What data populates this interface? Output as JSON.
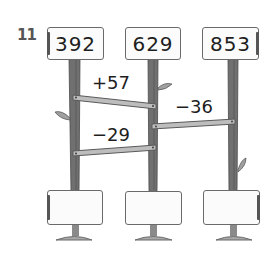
{
  "exercise": {
    "number": "11"
  },
  "top_signs": [
    {
      "value": "392"
    },
    {
      "value": "629"
    },
    {
      "value": "853"
    }
  ],
  "operations": [
    {
      "label": "+57",
      "from": "392",
      "to_post": 2
    },
    {
      "label": "−36",
      "from": "853",
      "to_post": 2
    },
    {
      "label": "−29",
      "from": "629",
      "to_post": 1
    }
  ],
  "bottom_signs": [
    {
      "value": ""
    },
    {
      "value": ""
    },
    {
      "value": ""
    }
  ],
  "colors": {
    "post": "#6e6e6e",
    "post_dark": "#4a4a4a",
    "plank": "#bdbdbd",
    "sign_border": "#6a6a6a",
    "base": "#a8a8a8",
    "text": "#1e1e1e"
  }
}
